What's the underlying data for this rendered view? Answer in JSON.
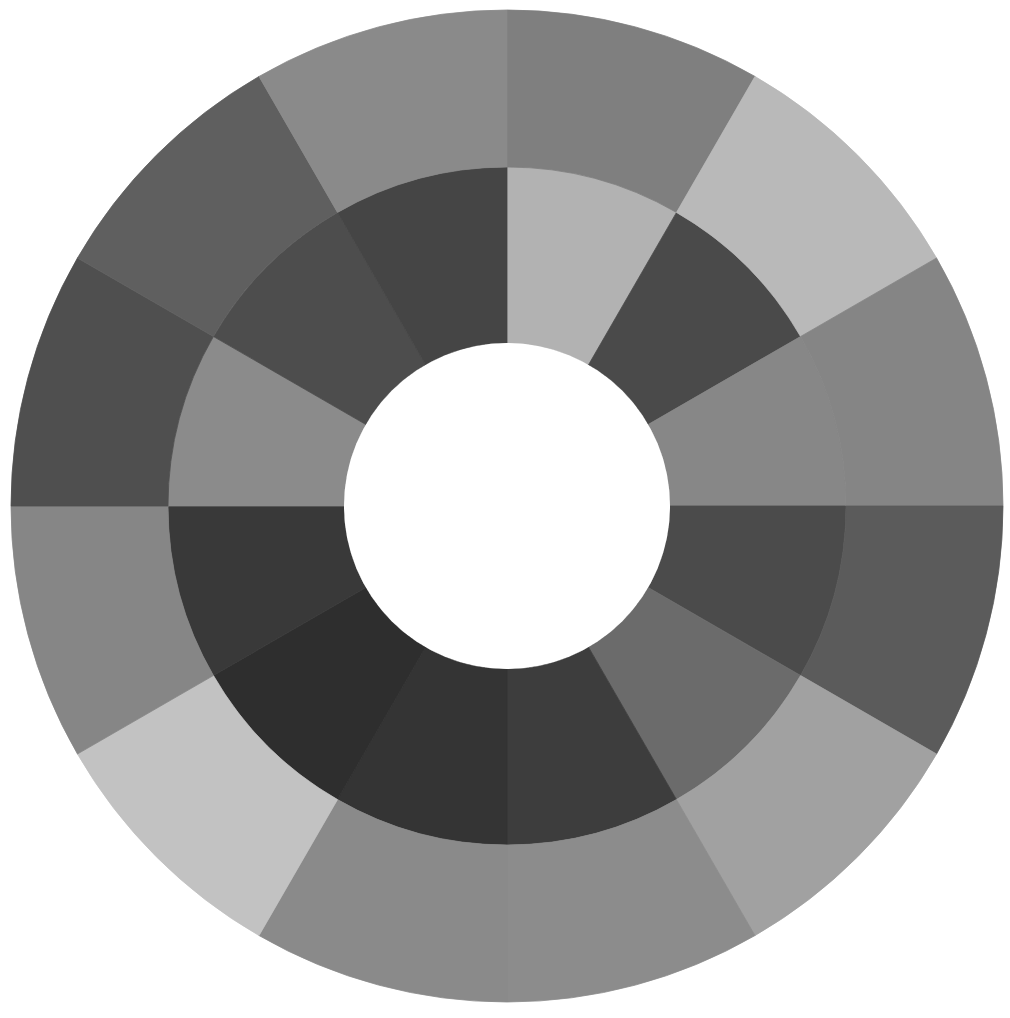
{
  "diagram": {
    "type": "grayscale-color-wheel",
    "background": "#ffffff",
    "center": {
      "x": 507,
      "y": 506
    },
    "radii": {
      "hole": 163,
      "middle": 339,
      "outer": 496
    },
    "segment_count": 12,
    "start_angle_deg": 0,
    "direction": "clockwise-from-top",
    "hole_color": "#ffffff",
    "rings": [
      {
        "name": "inner-ring",
        "inner_radius_key": "hole",
        "outer_radius_key": "middle",
        "colors": [
          "#b2b2b2",
          "#4a4a4a",
          "#878787",
          "#4b4b4b",
          "#6b6b6b",
          "#3d3d3d",
          "#343434",
          "#2e2e2e",
          "#393939",
          "#8b8b8b",
          "#4d4d4d",
          "#454545"
        ]
      },
      {
        "name": "outer-ring",
        "inner_radius_key": "middle",
        "outer_radius_key": "outer",
        "colors": [
          "#7f7f7f",
          "#b9b9b9",
          "#858585",
          "#5b5b5b",
          "#a1a1a1",
          "#8c8c8c",
          "#8a8a8a",
          "#c2c2c2",
          "#868686",
          "#4f4f4f",
          "#5f5f5f",
          "#8a8a8a"
        ]
      }
    ]
  }
}
